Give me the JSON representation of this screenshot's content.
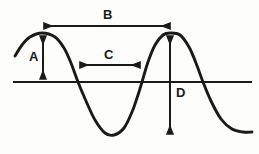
{
  "figure": {
    "type": "wave-diagram",
    "background_color": "#fdfdfc",
    "ink_color": "#1a1a18"
  },
  "labels": {
    "amplitude": "A",
    "wavelength": "B",
    "half_wavelength": "C",
    "peak_to_peak": "D"
  },
  "chart_data": {
    "type": "line",
    "title": "",
    "xlabel": "",
    "ylabel": "",
    "grid": false,
    "legend": null,
    "baseline_y": 82,
    "axis_line": {
      "x_start": 13,
      "x_end": 252,
      "y": 82
    },
    "wave_points": [
      {
        "x": 15,
        "y": 56
      },
      {
        "x": 22,
        "y": 45
      },
      {
        "x": 30,
        "y": 37
      },
      {
        "x": 42,
        "y": 33
      },
      {
        "x": 55,
        "y": 37
      },
      {
        "x": 64,
        "y": 48
      },
      {
        "x": 71,
        "y": 63
      },
      {
        "x": 78,
        "y": 82
      },
      {
        "x": 86,
        "y": 101
      },
      {
        "x": 95,
        "y": 120
      },
      {
        "x": 105,
        "y": 133
      },
      {
        "x": 114,
        "y": 135
      },
      {
        "x": 124,
        "y": 128
      },
      {
        "x": 132,
        "y": 112
      },
      {
        "x": 138,
        "y": 95
      },
      {
        "x": 142,
        "y": 82
      },
      {
        "x": 148,
        "y": 62
      },
      {
        "x": 155,
        "y": 45
      },
      {
        "x": 163,
        "y": 35
      },
      {
        "x": 170,
        "y": 33
      },
      {
        "x": 180,
        "y": 35
      },
      {
        "x": 189,
        "y": 47
      },
      {
        "x": 196,
        "y": 63
      },
      {
        "x": 203,
        "y": 82
      },
      {
        "x": 211,
        "y": 101
      },
      {
        "x": 221,
        "y": 119
      },
      {
        "x": 232,
        "y": 129
      },
      {
        "x": 243,
        "y": 132
      },
      {
        "x": 252,
        "y": 132
      }
    ],
    "annotations": [
      {
        "id": "A",
        "label": "A",
        "measure": "amplitude",
        "orientation": "vertical",
        "arrowheads": "both",
        "x": 43,
        "y_start": 34,
        "y_end": 81,
        "label_x": 29,
        "label_y": 50
      },
      {
        "id": "B",
        "label": "B",
        "measure": "wavelength",
        "orientation": "horizontal",
        "arrowheads": "both",
        "y": 26,
        "x_start": 42,
        "x_end": 172,
        "label_x": 103,
        "label_y": 8
      },
      {
        "id": "C",
        "label": "C",
        "measure": "half-wavelength",
        "orientation": "horizontal",
        "arrowheads": "both",
        "y": 65,
        "x_start": 78,
        "x_end": 142,
        "label_x": 104,
        "label_y": 48
      },
      {
        "id": "D",
        "label": "D",
        "measure": "peak-to-peak",
        "orientation": "vertical",
        "arrowheads": "both",
        "x": 170,
        "y_start": 34,
        "y_end": 136,
        "label_x": 176,
        "label_y": 86
      }
    ]
  }
}
